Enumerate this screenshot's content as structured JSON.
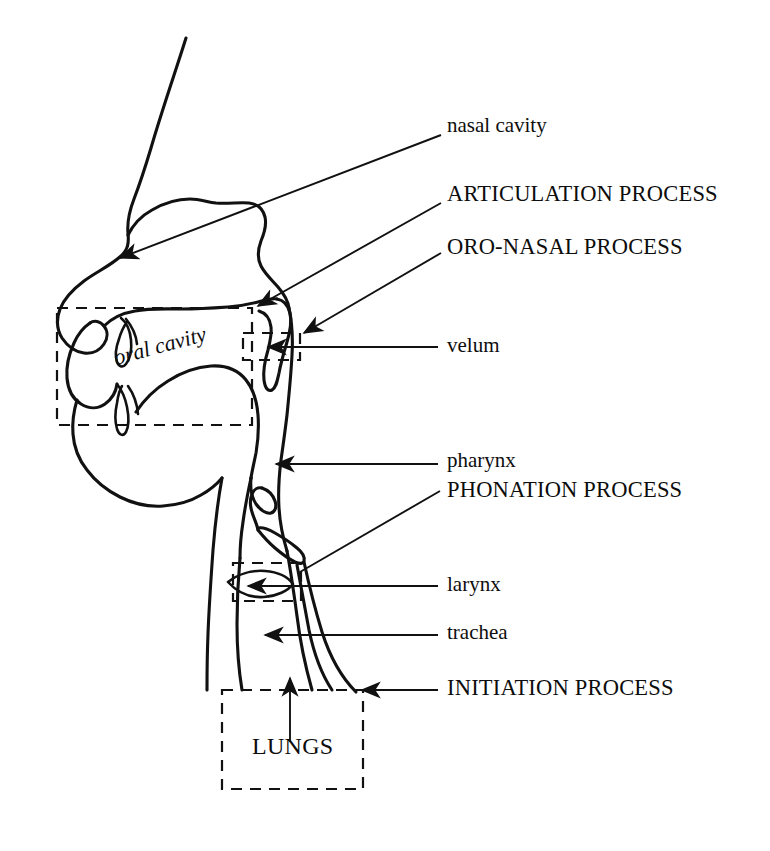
{
  "figure": {
    "background_color": "#ffffff",
    "line_color": "#111111"
  },
  "labels": {
    "nasal_cavity": "nasal cavity",
    "articulation_process": "ARTICULATION PROCESS",
    "oro_nasal_process": "ORO-NASAL PROCESS",
    "velum": "velum",
    "oral_cavity": "oral cavity",
    "pharynx": "pharynx",
    "phonation_process": "PHONATION PROCESS",
    "larynx": "larynx",
    "trachea": "trachea",
    "initiation_process": "INITIATION PROCESS",
    "lungs": "LUNGS"
  },
  "annotations": [
    {
      "id": "nasal-cavity",
      "text": "nasal cavity",
      "style": "lowercase",
      "leader": "diagonal",
      "target": "nasal cavity interior"
    },
    {
      "id": "articulation-process",
      "text": "ARTICULATION PROCESS",
      "style": "caps",
      "leader": "diagonal",
      "target": "velum / upper articulators"
    },
    {
      "id": "oro-nasal-process",
      "text": "ORO-NASAL PROCESS",
      "style": "caps",
      "leader": "diagonal",
      "target": "velic port"
    },
    {
      "id": "velum",
      "text": "velum",
      "style": "lowercase",
      "leader": "horizontal",
      "target": "velum"
    },
    {
      "id": "pharynx",
      "text": "pharynx",
      "style": "lowercase",
      "leader": "horizontal",
      "target": "pharyngeal wall"
    },
    {
      "id": "phonation-process",
      "text": "PHONATION PROCESS",
      "style": "caps",
      "leader": "diagonal",
      "target": "larynx"
    },
    {
      "id": "larynx",
      "text": "larynx",
      "style": "lowercase",
      "leader": "horizontal",
      "target": "vocal folds"
    },
    {
      "id": "trachea",
      "text": "trachea",
      "style": "lowercase",
      "leader": "horizontal",
      "target": "trachea"
    },
    {
      "id": "initiation-process",
      "text": "INITIATION PROCESS",
      "style": "caps",
      "leader": "horizontal",
      "target": "lungs"
    },
    {
      "id": "lungs",
      "text": "LUNGS",
      "style": "caps",
      "leader": "vertical-arrow",
      "target": "lungs box"
    }
  ],
  "dashed_regions": [
    {
      "id": "oral-cavity-region",
      "label": "oral cavity"
    },
    {
      "id": "velic-port-region",
      "label": "velum"
    },
    {
      "id": "larynx-region",
      "label": "larynx"
    },
    {
      "id": "lungs-region",
      "label": "LUNGS"
    }
  ]
}
